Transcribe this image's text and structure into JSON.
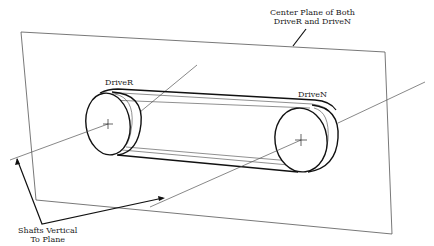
{
  "diagram": {
    "title_label": {
      "line1": "Center Plane of Both",
      "line2": "DriveR and DriveN"
    },
    "driver_label": "DriveR",
    "driven_label": "DriveN",
    "shafts_label": {
      "line1": "Shafts Vertical",
      "line2": "To Plane"
    },
    "colors": {
      "line": "#1a1a1a",
      "thin_line": "#555555",
      "background": "#ffffff"
    }
  }
}
